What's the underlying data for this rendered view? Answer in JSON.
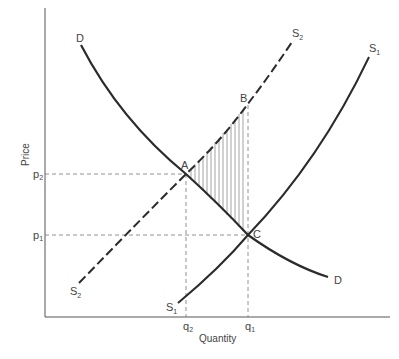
{
  "diagram": {
    "type": "supply-demand",
    "axes": {
      "x_label": "Quantity",
      "y_label": "Price",
      "x_ticks": [
        {
          "base": "q",
          "sub": "2"
        },
        {
          "base": "q",
          "sub": "1"
        }
      ],
      "y_ticks": [
        {
          "base": "p",
          "sub": "2"
        },
        {
          "base": "p",
          "sub": "1"
        }
      ]
    },
    "curves": {
      "demand": {
        "label_top": "D",
        "label_bottom": "D",
        "style": "solid"
      },
      "supply_original": {
        "base": "S",
        "sub": "1",
        "style": "solid"
      },
      "supply_shifted": {
        "base": "S",
        "sub": "2",
        "style": "dashed"
      }
    },
    "points": {
      "A": "A",
      "B": "B",
      "C": "C"
    },
    "shaded_region": "A-B-C (vertical hatching)",
    "colors": {
      "line": "#2b2b2b",
      "guide": "#777777",
      "hatch": "#8a8a8a"
    }
  }
}
